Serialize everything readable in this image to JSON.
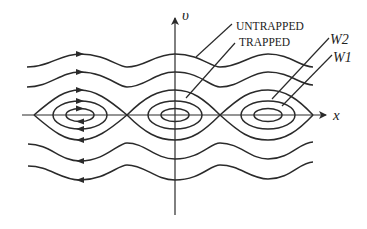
{
  "diagram": {
    "axes": {
      "horizontal": "x",
      "vertical": "υ"
    },
    "labels": {
      "untrapped": "UNTRAPPED",
      "trapped": "TRAPPED",
      "w2": "W2",
      "w1": "W1"
    },
    "colors": {
      "ink": "#2a2a2a",
      "background": "#ffffff"
    }
  }
}
